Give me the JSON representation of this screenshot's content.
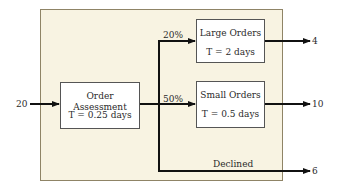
{
  "diagram": {
    "input": {
      "value": "20"
    },
    "process": {
      "title": "Order Assessment",
      "time": "T = 0.25 days"
    },
    "branches": [
      {
        "name": "large",
        "percent": "20%",
        "title": "Large Orders",
        "time": "T = 2 days",
        "output": "4"
      },
      {
        "name": "small",
        "percent": "50%",
        "title": "Small Orders",
        "time": "T = 0.5 days",
        "output": "10"
      },
      {
        "name": "declined",
        "label": "Declined",
        "output": "6"
      }
    ],
    "colors": {
      "frame_bg": "#f8f3e2",
      "frame_border": "#8f8466",
      "box_bg": "#ffffff",
      "line": "#111111"
    }
  }
}
